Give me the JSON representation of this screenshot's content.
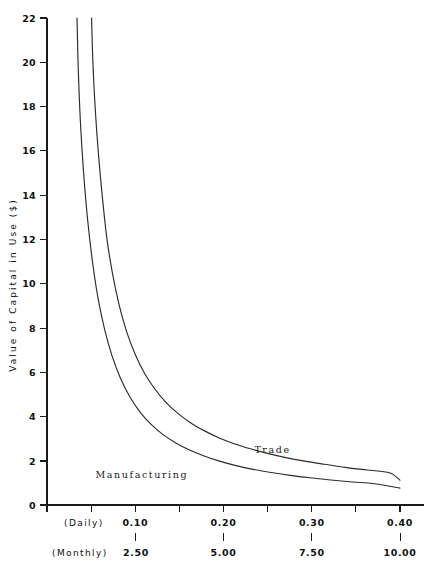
{
  "chart_data": {
    "type": "line",
    "title": "",
    "subtitle": "",
    "xlabel": "",
    "ylabel": "Value of Capital in Use ($)",
    "grid": false,
    "legend_position": "inline-annotations",
    "xlim": [
      0.0,
      0.42
    ],
    "ylim": [
      0,
      22
    ],
    "yticks": [
      0,
      2,
      4,
      6,
      8,
      10,
      12,
      14,
      16,
      18,
      20,
      22
    ],
    "ytick_labels": [
      "0",
      "2",
      "4",
      "6",
      "8",
      "10",
      "12",
      "14",
      "16",
      "18",
      "20",
      "22"
    ],
    "x_axes": [
      {
        "name": "(Daily)",
        "ticks": [
          0.0,
          0.05,
          0.1,
          0.15,
          0.2,
          0.25,
          0.3,
          0.35,
          0.4
        ],
        "labeled_ticks": [
          0.1,
          0.2,
          0.3,
          0.4
        ],
        "labels": [
          "0.10",
          "0.20",
          "0.30",
          "0.40"
        ]
      },
      {
        "name": "(Monthly)",
        "ticks": [
          2.5,
          5.0,
          7.5,
          10.0
        ],
        "labeled_ticks": [
          2.5,
          5.0,
          7.5,
          10.0
        ],
        "labels": [
          "2.50",
          "5.00",
          "7.50",
          "10.00"
        ]
      }
    ],
    "series": [
      {
        "name": "Trade",
        "label_x": 0.235,
        "label_y": 2.35,
        "x": [
          0.0505,
          0.052,
          0.0545,
          0.058,
          0.0625,
          0.068,
          0.0745,
          0.082,
          0.0905,
          0.1,
          0.1105,
          0.122,
          0.1345,
          0.148,
          0.1625,
          0.178,
          0.1945,
          0.212,
          0.2305,
          0.25,
          0.2705,
          0.292,
          0.3145,
          0.338,
          0.3625,
          0.388,
          0.4
        ],
        "y": [
          22.0,
          20.0,
          18.0,
          16.0,
          14.0,
          12.0,
          10.4,
          9.0,
          7.8,
          6.8,
          5.95,
          5.25,
          4.65,
          4.15,
          3.72,
          3.36,
          3.04,
          2.77,
          2.54,
          2.33,
          2.14,
          1.98,
          1.84,
          1.7,
          1.58,
          1.46,
          1.12
        ]
      },
      {
        "name": "Manufacturing",
        "label_x": 0.055,
        "label_y": 1.2,
        "x": [
          0.034,
          0.0355,
          0.038,
          0.0415,
          0.046,
          0.0515,
          0.058,
          0.0655,
          0.074,
          0.0835,
          0.094,
          0.1055,
          0.118,
          0.1315,
          0.146,
          0.1615,
          0.178,
          0.1955,
          0.214,
          0.2335,
          0.254,
          0.2755,
          0.298,
          0.3215,
          0.346,
          0.3715,
          0.4
        ],
        "y": [
          22.0,
          19.6,
          17.2,
          15.0,
          12.9,
          11.0,
          9.3,
          7.9,
          6.7,
          5.7,
          4.88,
          4.2,
          3.64,
          3.18,
          2.8,
          2.48,
          2.21,
          1.98,
          1.78,
          1.61,
          1.47,
          1.34,
          1.23,
          1.13,
          1.04,
          0.96,
          0.76
        ]
      }
    ]
  },
  "annotations": {
    "daily_axis_name": "(Daily)",
    "monthly_axis_name": "(Monthly)"
  }
}
